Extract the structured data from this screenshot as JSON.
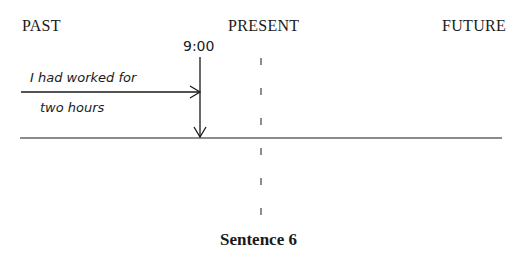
{
  "timeline": {
    "labels": {
      "past": "PAST",
      "present": "PRESENT",
      "future": "FUTURE"
    },
    "time_marker": "9:00",
    "event_text_line1": "I had worked for",
    "event_text_line2": "two hours",
    "caption": "Sentence 6",
    "colors": {
      "ink": "#1a1a1a",
      "background": "#ffffff"
    }
  }
}
